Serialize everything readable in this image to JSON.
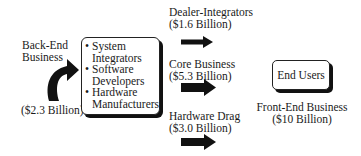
{
  "back_end": {
    "title_line1": "Back-End",
    "title_line2": "Business",
    "value": "($2.3 Billion)"
  },
  "center_box": {
    "items": [
      {
        "line1": "System",
        "line2": "Integrators"
      },
      {
        "line1": "Software",
        "line2": "Developers"
      },
      {
        "line1": "Hardware",
        "line2": "Manufacturers"
      }
    ]
  },
  "flows": [
    {
      "label": "Dealer-Integrators",
      "value": "($1.6 Billion)"
    },
    {
      "label": "Core Business",
      "value": "($5.3 Billion)"
    },
    {
      "label": "Hardware Drag",
      "value": "($3.0 Billion)"
    }
  ],
  "end_users": {
    "label": "End Users",
    "caption_line1": "Front-End Business",
    "caption_line2": "($10 Billion)"
  },
  "colors": {
    "arrow": "#111111",
    "text": "#1a1a1a",
    "background": "#ffffff"
  }
}
